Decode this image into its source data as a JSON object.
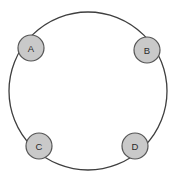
{
  "diagram": {
    "type": "ring-network-topology",
    "background_color": "#ffffff",
    "canvas": {
      "width": 176,
      "height": 181
    },
    "ring": {
      "name": "ring-link",
      "center_x": 88,
      "center_y": 91,
      "radius": 79,
      "stroke_color": "#3f3f3f",
      "stroke_width": 1.3,
      "fill": "none"
    },
    "node_style": {
      "radius": 13,
      "fill_color": "#c9c9c9",
      "stroke_color": "#555555",
      "stroke_width": 1.2,
      "label_color": "#2b2b2b"
    },
    "nodes": [
      {
        "id": "a",
        "label": "A",
        "cx": 31,
        "cy": 48,
        "angle_deg": 135
      },
      {
        "id": "b",
        "label": "B",
        "cx": 147,
        "cy": 50,
        "angle_deg": 45
      },
      {
        "id": "c",
        "label": "C",
        "cx": 39,
        "cy": 146,
        "angle_deg": 225
      },
      {
        "id": "d",
        "label": "D",
        "cx": 135,
        "cy": 146,
        "angle_deg": 315
      }
    ]
  }
}
